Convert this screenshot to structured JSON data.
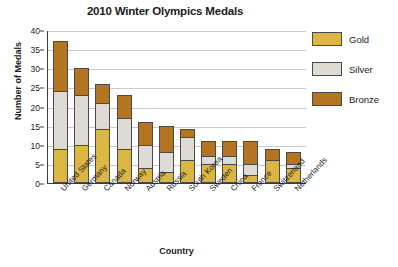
{
  "chart_data": {
    "type": "bar",
    "subtype": "stacked-vertical-bar",
    "title": "2010 Winter Olympics Medals",
    "xlabel": "Country",
    "ylabel": "Number of Medals",
    "ylim": [
      0,
      40
    ],
    "ytick_step": 5,
    "yticks": [
      0,
      5,
      10,
      15,
      20,
      25,
      30,
      35,
      40
    ],
    "grid": true,
    "grid_axis": "y",
    "legend_position": "right",
    "categories": [
      "United States",
      "Germany",
      "Canada",
      "Norway",
      "Austria",
      "Russia",
      "South Korea",
      "Sweden",
      "China",
      "France",
      "Switzerland",
      "Netherlands"
    ],
    "series": [
      {
        "name": "Gold",
        "color": "#dcb643",
        "values": [
          9,
          10,
          14,
          9,
          4,
          3,
          6,
          5,
          5,
          2,
          6,
          4
        ]
      },
      {
        "name": "Silver",
        "color": "#dedbd4",
        "values": [
          15,
          13,
          7,
          8,
          6,
          5,
          6,
          2,
          2,
          3,
          0,
          1
        ]
      },
      {
        "name": "Bronze",
        "color": "#b5741f",
        "values": [
          13,
          7,
          5,
          6,
          6,
          7,
          2,
          4,
          4,
          6,
          3,
          3
        ]
      }
    ],
    "totals": [
      37,
      30,
      26,
      23,
      16,
      15,
      14,
      11,
      11,
      11,
      9,
      8
    ]
  },
  "legend": {
    "items": [
      {
        "label": "Gold",
        "color": "#dcb643"
      },
      {
        "label": "Silver",
        "color": "#dedbd4"
      },
      {
        "label": "Bronze",
        "color": "#b5741f"
      }
    ]
  }
}
